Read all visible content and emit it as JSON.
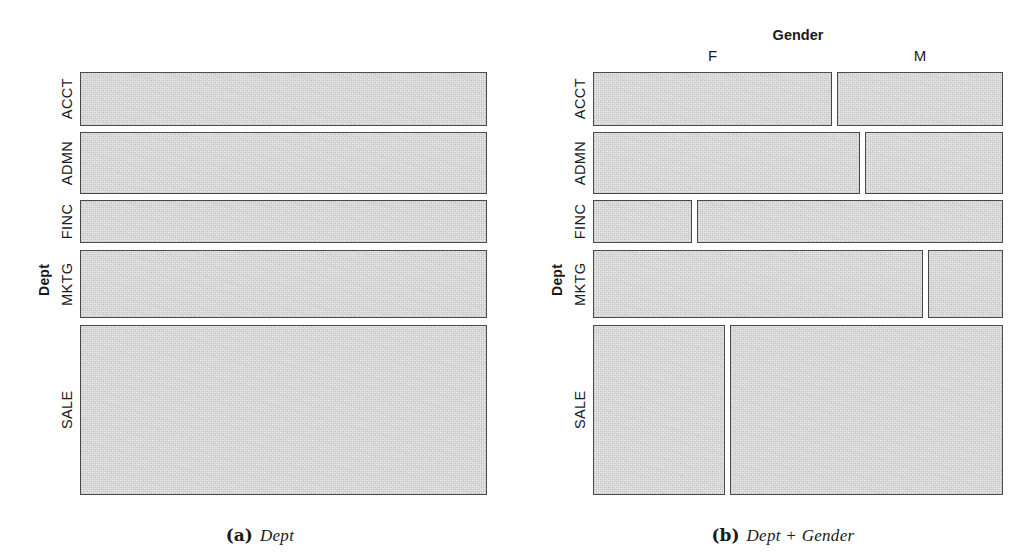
{
  "figure": {
    "panels": [
      {
        "id": "a",
        "caption_tag": "(a)",
        "caption_text": "Dept",
        "y_axis_title": "Dept",
        "x_axis_title": "",
        "x_tick_labels": []
      },
      {
        "id": "b",
        "caption_tag": "(b)",
        "caption_text": "Dept + Gender",
        "y_axis_title": "Dept",
        "x_axis_title": "Gender",
        "x_tick_labels": [
          "F",
          "M"
        ]
      }
    ]
  },
  "style": {
    "tile_fill": "#e9e9e9",
    "tile_border": "#4a4a4a",
    "background": "#ffffff",
    "text_color": "#1a1a1a"
  },
  "chart_data": [
    {
      "type": "mosaic",
      "panel": "a",
      "title": "Dept",
      "xlabel": "",
      "ylabel": "Dept",
      "categories": [
        "ACCT",
        "ADMN",
        "FINC",
        "MKTG",
        "SALE"
      ],
      "values": [
        12.8,
        14.7,
        10.2,
        16.1,
        40.2
      ],
      "value_unit": "percent of total",
      "grid": false,
      "legend": "none",
      "rows": [
        {
          "label": "ACCT",
          "top_pct": 0.0,
          "height_pct": 12.8
        },
        {
          "label": "ADMN",
          "top_pct": 14.2,
          "height_pct": 14.7
        },
        {
          "label": "FINC",
          "top_pct": 30.3,
          "height_pct": 10.2
        },
        {
          "label": "MKTG",
          "top_pct": 42.1,
          "height_pct": 16.1
        },
        {
          "label": "SALE",
          "top_pct": 59.8,
          "height_pct": 40.2
        }
      ]
    },
    {
      "type": "mosaic",
      "panel": "b",
      "title": "Dept + Gender",
      "xlabel": "Gender",
      "ylabel": "Dept",
      "categories": [
        "ACCT",
        "ADMN",
        "FINC",
        "MKTG",
        "SALE"
      ],
      "series": [
        {
          "name": "F",
          "values": [
            59.0,
            66.0,
            24.5,
            81.5,
            32.5
          ]
        },
        {
          "name": "M",
          "values": [
            41.0,
            34.0,
            75.5,
            18.5,
            67.5
          ]
        }
      ],
      "value_unit": "percent within department",
      "grid": false,
      "legend": "none",
      "rows": [
        {
          "label": "ACCT",
          "top_pct": 0.0,
          "height_pct": 12.8,
          "f_pct": 59.0,
          "m_pct": 41.0
        },
        {
          "label": "ADMN",
          "top_pct": 14.2,
          "height_pct": 14.7,
          "f_pct": 66.0,
          "m_pct": 34.0
        },
        {
          "label": "FINC",
          "top_pct": 30.3,
          "height_pct": 10.2,
          "f_pct": 24.5,
          "m_pct": 75.5
        },
        {
          "label": "MKTG",
          "top_pct": 42.1,
          "height_pct": 16.1,
          "f_pct": 81.5,
          "m_pct": 18.5
        },
        {
          "label": "SALE",
          "top_pct": 59.8,
          "height_pct": 40.2,
          "f_pct": 32.5,
          "m_pct": 67.5
        }
      ]
    }
  ]
}
